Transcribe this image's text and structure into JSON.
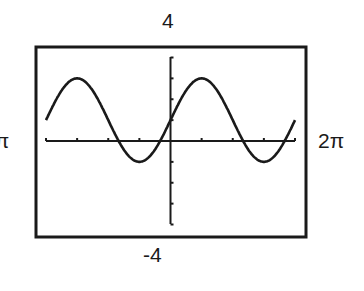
{
  "chart_data": {
    "type": "line",
    "title": "",
    "function": "y = 1 + 2 sin(x)",
    "xlabel": "",
    "ylabel": "",
    "xlim": [
      "-2π",
      "2π"
    ],
    "ylim": [
      -4,
      4
    ],
    "window_labels": {
      "ymax": "4",
      "ymin": "-4",
      "xmax": "2π",
      "xmin": "-2π"
    },
    "x_tick_step": "π/2",
    "y_tick_step": 1,
    "grid": false,
    "series": [
      {
        "name": "y = 1 + 2 sin x",
        "x": [
          -6.283,
          -4.712,
          -3.142,
          -1.571,
          0,
          1.571,
          3.142,
          4.712,
          6.283
        ],
        "values": [
          1,
          3,
          1,
          -1,
          1,
          3,
          1,
          -1,
          1
        ]
      }
    ]
  }
}
